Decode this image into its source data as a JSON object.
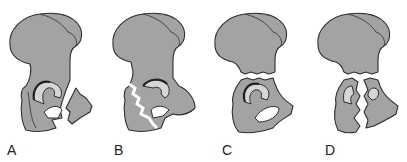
{
  "figure": {
    "colors": {
      "bone": "#a3a3a3",
      "cartilage": "#d6d6d6",
      "outline": "#2e2e2e",
      "background": "#ffffff"
    },
    "panels": [
      {
        "label": "A",
        "x": 7
      },
      {
        "label": "B",
        "x": 114
      },
      {
        "label": "C",
        "x": 222
      },
      {
        "label": "D",
        "x": 325
      }
    ]
  }
}
